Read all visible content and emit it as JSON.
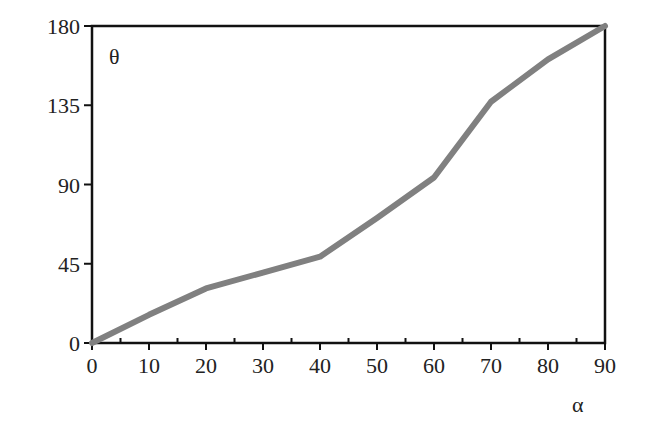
{
  "chart_data": {
    "type": "line",
    "title": "",
    "xlabel": "α",
    "ylabel": "θ",
    "xlim": [
      0,
      90
    ],
    "ylim": [
      0,
      180
    ],
    "grid": false,
    "legend": null,
    "x_ticks": [
      0,
      10,
      20,
      30,
      40,
      50,
      60,
      70,
      80,
      90
    ],
    "y_ticks": [
      0,
      45,
      90,
      135,
      180
    ],
    "series": [
      {
        "name": "θ vs α",
        "color": "#808080",
        "x": [
          0,
          10,
          20,
          30,
          40,
          50,
          60,
          70,
          80,
          90
        ],
        "y": [
          0,
          16,
          31,
          40,
          49,
          71,
          94,
          137,
          161,
          180
        ]
      }
    ]
  },
  "labels": {
    "x_axis_symbol": "α",
    "y_axis_symbol": "θ"
  },
  "colors": {
    "axis": "#111111",
    "line": "#808080",
    "text": "#222222"
  }
}
